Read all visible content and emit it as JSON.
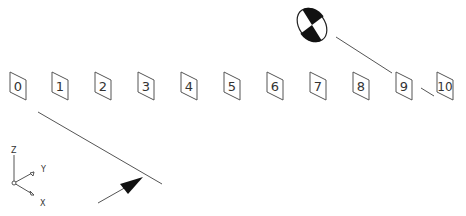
{
  "diagram": {
    "type": "cad-isometric-view",
    "line_color": "#555555",
    "fill_dark": "#111111",
    "boxes": [
      {
        "label": "0",
        "x": 10,
        "y": 72
      },
      {
        "label": "1",
        "x": 52,
        "y": 72
      },
      {
        "label": "2",
        "x": 95,
        "y": 72
      },
      {
        "label": "3",
        "x": 138,
        "y": 72
      },
      {
        "label": "4",
        "x": 181,
        "y": 72
      },
      {
        "label": "5",
        "x": 224,
        "y": 72
      },
      {
        "label": "6",
        "x": 267,
        "y": 72
      },
      {
        "label": "7",
        "x": 310,
        "y": 72
      },
      {
        "label": "8",
        "x": 353,
        "y": 72
      },
      {
        "label": "9",
        "x": 396,
        "y": 72
      },
      {
        "label": "10",
        "x": 437,
        "y": 72
      }
    ],
    "ucs_icon": {
      "x_label": "X",
      "y_label": "Y",
      "z_label": "Z"
    }
  }
}
